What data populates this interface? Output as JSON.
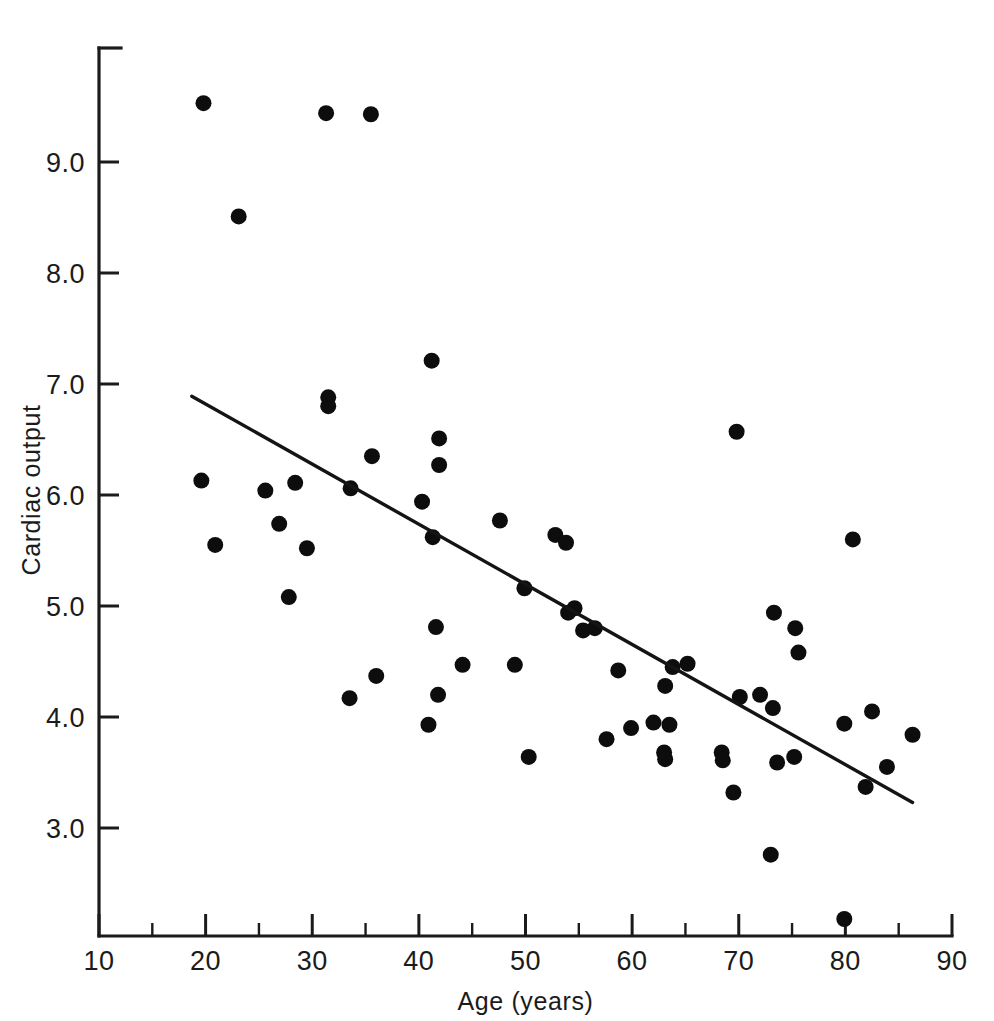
{
  "figure": {
    "background_color": "#ffffff",
    "ink_color": "#141414"
  },
  "chart_data": {
    "type": "scatter",
    "title": "",
    "subtitle": "",
    "xlabel": "Age (years)",
    "ylabel": "Cardiac output",
    "xlim": [
      10,
      90
    ],
    "ylim": [
      2.0,
      9.85
    ],
    "grid": false,
    "legend": null,
    "x_ticks_major": [
      10,
      20,
      30,
      40,
      50,
      60,
      70,
      80,
      90
    ],
    "x_ticks_major_labels": [
      "10",
      "20",
      "30",
      "40",
      "50",
      "60",
      "70",
      "80",
      "90"
    ],
    "x_ticks_minor": [
      15,
      25,
      35,
      45,
      55,
      65,
      75,
      85
    ],
    "y_ticks_major": [
      3.0,
      4.0,
      5.0,
      6.0,
      7.0,
      8.0,
      9.0
    ],
    "y_ticks_major_labels": [
      "3.0",
      "4.0",
      "5.0",
      "6.0",
      "7.0",
      "8.0",
      "9.0"
    ],
    "y_ticks_minor": [],
    "marker": "filled-circle",
    "marker_radius_px": 8,
    "points": [
      [
        19.8,
        9.53
      ],
      [
        31.3,
        9.44
      ],
      [
        35.5,
        9.43
      ],
      [
        23.1,
        8.51
      ],
      [
        41.2,
        7.21
      ],
      [
        31.5,
        6.88
      ],
      [
        31.5,
        6.8
      ],
      [
        69.8,
        6.57
      ],
      [
        41.9,
        6.51
      ],
      [
        35.6,
        6.35
      ],
      [
        41.9,
        6.27
      ],
      [
        19.6,
        6.13
      ],
      [
        28.4,
        6.11
      ],
      [
        25.6,
        6.04
      ],
      [
        33.6,
        6.06
      ],
      [
        40.3,
        5.94
      ],
      [
        26.9,
        5.74
      ],
      [
        47.6,
        5.77
      ],
      [
        52.8,
        5.64
      ],
      [
        41.3,
        5.62
      ],
      [
        53.8,
        5.57
      ],
      [
        80.7,
        5.6
      ],
      [
        20.9,
        5.55
      ],
      [
        29.5,
        5.52
      ],
      [
        49.9,
        5.16
      ],
      [
        27.8,
        5.08
      ],
      [
        73.3,
        4.94
      ],
      [
        54.6,
        4.98
      ],
      [
        54.0,
        4.94
      ],
      [
        75.3,
        4.8
      ],
      [
        41.6,
        4.81
      ],
      [
        56.5,
        4.8
      ],
      [
        55.4,
        4.78
      ],
      [
        75.6,
        4.58
      ],
      [
        65.2,
        4.48
      ],
      [
        49.0,
        4.47
      ],
      [
        44.1,
        4.47
      ],
      [
        63.8,
        4.45
      ],
      [
        58.7,
        4.42
      ],
      [
        36.0,
        4.37
      ],
      [
        63.1,
        4.28
      ],
      [
        70.1,
        4.18
      ],
      [
        33.5,
        4.17
      ],
      [
        72.0,
        4.2
      ],
      [
        41.8,
        4.2
      ],
      [
        73.2,
        4.08
      ],
      [
        82.5,
        4.05
      ],
      [
        79.9,
        3.94
      ],
      [
        62.0,
        3.95
      ],
      [
        63.5,
        3.93
      ],
      [
        40.9,
        3.93
      ],
      [
        59.9,
        3.9
      ],
      [
        86.3,
        3.84
      ],
      [
        57.6,
        3.8
      ],
      [
        63.0,
        3.68
      ],
      [
        63.1,
        3.62
      ],
      [
        68.4,
        3.68
      ],
      [
        68.5,
        3.61
      ],
      [
        50.3,
        3.64
      ],
      [
        75.2,
        3.64
      ],
      [
        73.6,
        3.59
      ],
      [
        83.9,
        3.55
      ],
      [
        81.9,
        3.37
      ],
      [
        69.5,
        3.32
      ],
      [
        73.0,
        2.76
      ],
      [
        79.9,
        2.18
      ]
    ],
    "fit_line": {
      "kind": "linear-regression",
      "x_start": 18.7,
      "y_start": 6.89,
      "x_end": 86.3,
      "y_end": 3.23
    }
  }
}
